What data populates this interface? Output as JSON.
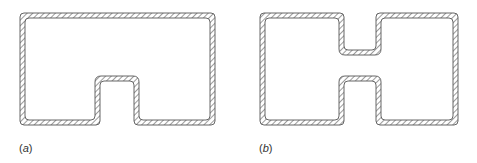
{
  "figure": {
    "colors": {
      "outline": "#555555",
      "hatch": "#666666",
      "background": "#ffffff",
      "label": "#333333"
    },
    "panels": [
      {
        "id": "a",
        "label_open": "(",
        "label_letter": "a",
        "label_close": ")",
        "shape": "Rectangular closed section with a single rectangular notch indented upward from the bottom edge"
      },
      {
        "id": "b",
        "label_open": "(",
        "label_letter": "b",
        "label_close": ")",
        "shape": "Rectangular closed section with two opposing notches (top and bottom) forming an H-like double-cell profile"
      }
    ]
  }
}
